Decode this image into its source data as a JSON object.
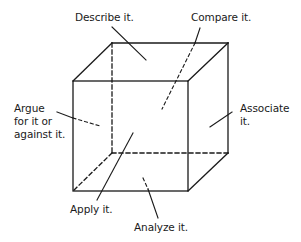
{
  "diagram": {
    "type": "cube",
    "faces": [
      {
        "id": "top",
        "label": "Describe it."
      },
      {
        "id": "back",
        "label": "Compare it."
      },
      {
        "id": "left",
        "label": "Argue\nfor it or\nagainst it."
      },
      {
        "id": "right",
        "label": "Associate\nit."
      },
      {
        "id": "front",
        "label": "Apply it."
      },
      {
        "id": "bottom",
        "label": "Analyze it."
      }
    ],
    "colors": {
      "line": "#1a1a1a",
      "background": "#ffffff"
    }
  },
  "labels": {
    "describe": "Describe it.",
    "compare": "Compare it.",
    "argue_1": "Argue",
    "argue_2": "for it or",
    "argue_3": "against it.",
    "associate_1": "Associate",
    "associate_2": "it.",
    "apply": "Apply it.",
    "analyze": "Analyze it."
  }
}
